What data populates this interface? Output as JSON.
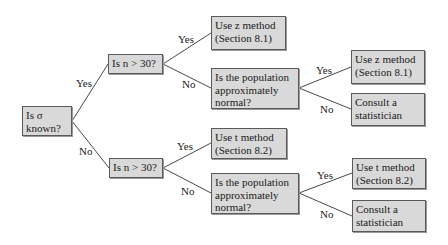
{
  "diagram": {
    "type": "decision-tree",
    "nodes": {
      "root": {
        "line1": "Is σ",
        "line2": "known?"
      },
      "n30_top": {
        "line1": "Is n > 30?"
      },
      "z_direct": {
        "line1": "Use z method",
        "line2": "(Section 8.1)"
      },
      "normal_top": {
        "line1": "Is the population",
        "line2": "approximately",
        "line3": "normal?"
      },
      "z_normal": {
        "line1": "Use z method",
        "line2": "(Section 8.1)"
      },
      "consult_top": {
        "line1": "Consult a",
        "line2": "statistician"
      },
      "n30_bottom": {
        "line1": "Is n > 30?"
      },
      "t_direct": {
        "line1": "Use t method",
        "line2": "(Section 8.2)"
      },
      "normal_bottom": {
        "line1": "Is the population",
        "line2": "approximately",
        "line3": "normal?"
      },
      "t_normal": {
        "line1": "Use t method",
        "line2": "(Section 8.2)"
      },
      "consult_bottom": {
        "line1": "Consult a",
        "line2": "statistician"
      }
    },
    "edge_labels": {
      "root_yes": "Yes",
      "root_no": "No",
      "n30_top_yes": "Yes",
      "n30_top_no": "No",
      "normal_top_yes": "Yes",
      "normal_top_no": "No",
      "n30_bottom_yes": "Yes",
      "n30_bottom_no": "No",
      "normal_bottom_yes": "Yes",
      "normal_bottom_no": "No"
    },
    "colors": {
      "node_fill": "#d9d9d9",
      "node_border": "#5a5a5a",
      "edge": "#4a4a4a"
    }
  }
}
